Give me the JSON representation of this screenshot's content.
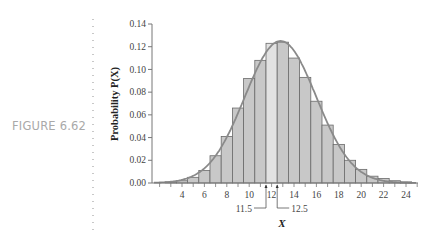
{
  "figure": {
    "label": "FIGURE 6.62"
  },
  "chart_data": {
    "type": "bar",
    "title": "",
    "xlabel": "X",
    "ylabel": "Probability P(X)",
    "ylim": [
      0,
      0.14
    ],
    "xlim": [
      1.5,
      25
    ],
    "yticks": [
      "0.00",
      "0.02",
      "0.04",
      "0.06",
      "0.08",
      "0.10",
      "0.12",
      "0.14"
    ],
    "xticks": [
      "4",
      "6",
      "8",
      "10",
      "12",
      "14",
      "16",
      "18",
      "20",
      "22",
      "24"
    ],
    "categories": [
      1,
      2,
      3,
      4,
      5,
      6,
      7,
      8,
      9,
      10,
      11,
      12,
      13,
      14,
      15,
      16,
      17,
      18,
      19,
      20,
      21,
      22,
      23,
      24
    ],
    "values": [
      0.0,
      0.0,
      0.001,
      0.002,
      0.005,
      0.011,
      0.024,
      0.041,
      0.066,
      0.092,
      0.108,
      0.123,
      0.124,
      0.11,
      0.093,
      0.072,
      0.051,
      0.034,
      0.02,
      0.012,
      0.006,
      0.004,
      0.002,
      0.001
    ],
    "highlighted_bar": 12,
    "overlay": {
      "type": "normal-curve",
      "mean": 12.8,
      "peak": 0.125
    },
    "annotations": [
      {
        "text": "11.5",
        "x": 11.5
      },
      {
        "text": "12.5",
        "x": 12.5
      }
    ],
    "grid": false,
    "colors": {
      "bar": "#c8c8c8",
      "highlight": "#e2e2e2",
      "bar_edge": "#6a6a6a",
      "curve": "#8a8a8a",
      "axis": "#777777"
    }
  }
}
